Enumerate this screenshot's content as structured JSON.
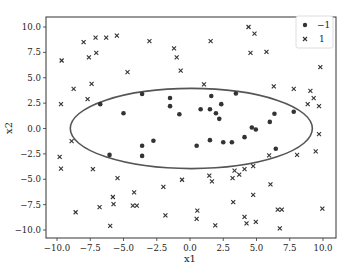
{
  "chart_data": {
    "type": "scatter",
    "title": "",
    "xlabel": "x1",
    "ylabel": "x2",
    "xlim": [
      -10.8,
      10.8
    ],
    "ylim": [
      -11.0,
      10.9
    ],
    "xticks": [
      -10.0,
      -7.5,
      -5.0,
      -2.5,
      0.0,
      2.5,
      5.0,
      7.5,
      10.0
    ],
    "xtick_labels": [
      "−10.0",
      "−7.5",
      "−5.0",
      "−2.5",
      "0.0",
      "2.5",
      "5.0",
      "7.5",
      "10.0"
    ],
    "yticks": [
      10.0,
      7.5,
      5.0,
      2.5,
      0.0,
      -2.5,
      -5.0,
      -7.5,
      -10.0
    ],
    "ytick_labels": [
      "10.0",
      "7.5",
      "5.0",
      "2.5",
      "0.0",
      "−2.5",
      "−5.0",
      "−7.5",
      "−10.0"
    ],
    "grid": false,
    "legend_position": "upper right",
    "series": [
      {
        "name": "−1",
        "marker": "circle",
        "color": "#333333",
        "points": [
          [
            -6.75,
            2.4
          ],
          [
            -5.0,
            1.5
          ],
          [
            -3.6,
            3.4
          ],
          [
            -1.5,
            3.0
          ],
          [
            -1.5,
            2.2
          ],
          [
            -0.8,
            1.4
          ],
          [
            1.6,
            3.2
          ],
          [
            3.45,
            3.45
          ],
          [
            0.8,
            1.9
          ],
          [
            1.5,
            1.9
          ],
          [
            2.35,
            2.4
          ],
          [
            1.95,
            1.5
          ],
          [
            2.2,
            0.95
          ],
          [
            6.35,
            1.45
          ],
          [
            6.0,
            0.65
          ],
          [
            7.8,
            1.65
          ],
          [
            -2.75,
            -1.2
          ],
          [
            0.5,
            -1.7
          ],
          [
            1.5,
            -1.15
          ],
          [
            2.5,
            -1.35
          ],
          [
            3.15,
            -1.35
          ],
          [
            4.1,
            -0.85
          ],
          [
            4.65,
            0.1
          ],
          [
            4.95,
            -0.1
          ],
          [
            6.45,
            -2.0
          ],
          [
            -6.05,
            -2.6
          ],
          [
            -3.6,
            -1.7
          ],
          [
            -3.6,
            -2.7
          ]
        ]
      },
      {
        "name": "1",
        "marker": "x",
        "color": "#333333",
        "points": [
          [
            -9.65,
            6.7
          ],
          [
            -8.0,
            8.5
          ],
          [
            -7.1,
            8.95
          ],
          [
            -6.3,
            8.95
          ],
          [
            -5.5,
            9.15
          ],
          [
            -7.6,
            7.0
          ],
          [
            -7.05,
            7.45
          ],
          [
            -3.05,
            8.6
          ],
          [
            -1.2,
            7.9
          ],
          [
            -1.0,
            7.0
          ],
          [
            -0.7,
            5.7
          ],
          [
            -4.7,
            5.55
          ],
          [
            -8.75,
            3.9
          ],
          [
            -7.4,
            4.4
          ],
          [
            -9.7,
            2.4
          ],
          [
            -7.7,
            2.9
          ],
          [
            4.4,
            10.0
          ],
          [
            4.85,
            9.35
          ],
          [
            1.55,
            8.6
          ],
          [
            4.55,
            7.45
          ],
          [
            5.75,
            7.55
          ],
          [
            9.8,
            6.05
          ],
          [
            1.05,
            4.35
          ],
          [
            6.3,
            4.15
          ],
          [
            7.8,
            3.9
          ],
          [
            9.05,
            3.7
          ],
          [
            9.3,
            3.0
          ],
          [
            8.85,
            2.4
          ],
          [
            9.7,
            2.2
          ],
          [
            -8.9,
            -1.25
          ],
          [
            -9.8,
            -2.8
          ],
          [
            -9.7,
            -3.95
          ],
          [
            -7.3,
            -4.0
          ],
          [
            -5.45,
            -4.9
          ],
          [
            -4.2,
            -6.3
          ],
          [
            -5.8,
            -6.75
          ],
          [
            -5.75,
            -7.45
          ],
          [
            -6.8,
            -7.75
          ],
          [
            -4.3,
            -7.6
          ],
          [
            -4.0,
            -7.6
          ],
          [
            -8.6,
            -8.25
          ],
          [
            -6.0,
            -9.6
          ],
          [
            -2.0,
            -5.75
          ],
          [
            -1.85,
            -8.55
          ],
          [
            -0.6,
            -5.05
          ],
          [
            9.7,
            -0.55
          ],
          [
            9.45,
            -2.25
          ],
          [
            8.05,
            -2.6
          ],
          [
            5.95,
            -2.65
          ],
          [
            4.75,
            -3.7
          ],
          [
            4.1,
            -4.0
          ],
          [
            3.7,
            -4.55
          ],
          [
            3.35,
            -4.15
          ],
          [
            3.2,
            -4.9
          ],
          [
            1.45,
            -4.65
          ],
          [
            1.65,
            -5.2
          ],
          [
            6.05,
            -5.5
          ],
          [
            4.75,
            -6.55
          ],
          [
            3.25,
            -7.25
          ],
          [
            0.55,
            -8.1
          ],
          [
            0.5,
            -8.9
          ],
          [
            1.9,
            -9.55
          ],
          [
            4.1,
            -8.7
          ],
          [
            4.25,
            -9.35
          ],
          [
            4.95,
            -9.2
          ],
          [
            6.6,
            -8.0
          ],
          [
            6.9,
            -8.0
          ],
          [
            6.75,
            -9.85
          ],
          [
            9.95,
            -7.9
          ]
        ]
      }
    ],
    "annotations": [
      {
        "type": "ellipse",
        "description": "decision boundary",
        "center": [
          0.1,
          0.0
        ],
        "semi_axis_x": 9.1,
        "semi_axis_y": 3.95,
        "color": "#555555"
      }
    ]
  },
  "legend": {
    "items": [
      {
        "label": "−1",
        "marker": "circle"
      },
      {
        "label": "1",
        "marker": "x"
      }
    ]
  }
}
